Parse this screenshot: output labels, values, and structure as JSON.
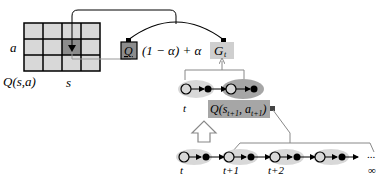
{
  "diagram": {
    "type": "td-update-illustration",
    "grid": {
      "rows": 3,
      "cols": 4,
      "highlight_cell": {
        "row": 1,
        "col": 2
      },
      "row_label": "a",
      "col_label": "s",
      "table_label": "Q(s,a)",
      "cell_color": "#d8d8d8",
      "highlight_color": "#8c8c8c"
    },
    "update_rule": {
      "q_box_label": "Q",
      "q_box_color": "#8c8c8c",
      "middle_text": "(1 − α) + α",
      "target_label": "G",
      "target_subscript": "t",
      "target_box_color": "#cfcfcf"
    },
    "mid_chain": {
      "time_label": "t",
      "bootstrap_label": "Q(s",
      "bootstrap_sub1": "t+1",
      "bootstrap_mid": ", a",
      "bootstrap_sub2": "t+1",
      "bootstrap_close": ")",
      "bootstrap_color": "#a6a6a6"
    },
    "bottom_chain": {
      "time_labels": [
        "t",
        "t+1",
        "t+2"
      ],
      "ellipsis": "...",
      "infinity": "∞"
    }
  }
}
